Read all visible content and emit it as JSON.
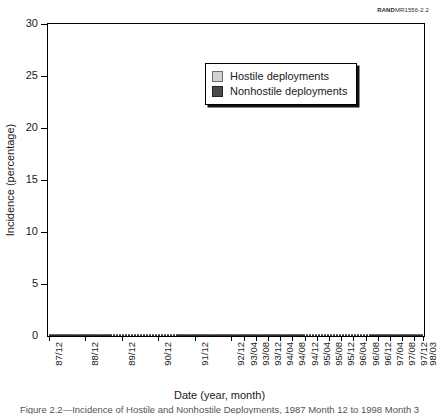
{
  "figure": {
    "rand_code_bold": "RAND",
    "rand_code_rest": "MR1556-2.2",
    "caption": "Figure 2.2—Incidence of Hostile and Nonhostile Deployments, 1987 Month 12 to 1998 Month 3"
  },
  "legend": {
    "items": [
      {
        "label": "Hostile deployments",
        "color": "#d2d2d2"
      },
      {
        "label": "Nonhostile deployments",
        "color": "#4a4a4a"
      }
    ]
  },
  "axes": {
    "ylabel": "Incidence (percentage)",
    "xlabel": "Date (year, month)",
    "yticks": [
      0,
      5,
      10,
      15,
      20,
      25,
      30
    ],
    "xticklabels": [
      "87/12",
      "88/12",
      "89/12",
      "90/12",
      "91/12",
      "92/12",
      "93/04",
      "93/08",
      "93/12",
      "94/04",
      "94/08",
      "94/12",
      "95/04",
      "95/08",
      "95/12",
      "96/04",
      "96/08",
      "96/12",
      "97/04",
      "97/08",
      "97/12",
      "98/03"
    ]
  },
  "chart_data": {
    "type": "bar",
    "title": "",
    "subtitle": "",
    "stacked": true,
    "xlabel": "Date (year, month)",
    "ylabel": "Incidence (percentage)",
    "ylim": [
      0,
      30
    ],
    "grid": false,
    "legend_position": "top-center",
    "annotations": [
      "RANDMR1556-2.2"
    ],
    "categories": [
      "87/12",
      "88/01",
      "88/02",
      "88/03",
      "88/04",
      "88/05",
      "88/06",
      "88/07",
      "88/08",
      "88/09",
      "88/10",
      "88/11",
      "88/12",
      "89/01",
      "89/02",
      "89/03",
      "89/04",
      "89/05",
      "89/06",
      "89/07",
      "89/08",
      "89/09",
      "89/10",
      "89/11",
      "89/12",
      "90/01",
      "90/02",
      "90/03",
      "90/04",
      "90/05",
      "90/06",
      "90/07",
      "90/08",
      "90/09",
      "90/10",
      "90/11",
      "90/12",
      "91/01",
      "91/02",
      "91/03",
      "91/04",
      "91/05",
      "91/06",
      "91/07",
      "91/08",
      "91/09",
      "91/10",
      "91/11",
      "91/12",
      "92/01",
      "92/02",
      "92/03",
      "92/04",
      "92/05",
      "92/06",
      "92/07",
      "92/08",
      "92/09",
      "92/10",
      "92/11",
      "92/12",
      "93/01",
      "93/02",
      "93/03",
      "93/04",
      "93/05",
      "93/06",
      "93/07",
      "93/08",
      "93/09",
      "93/10",
      "93/11",
      "93/12",
      "94/01",
      "94/02",
      "94/03",
      "94/04",
      "94/05",
      "94/06",
      "94/07",
      "94/08",
      "94/09",
      "94/10",
      "94/11",
      "94/12",
      "95/01",
      "95/02",
      "95/03",
      "95/04",
      "95/05",
      "95/06",
      "95/07",
      "95/08",
      "95/09",
      "95/10",
      "95/11",
      "95/12",
      "96/01",
      "96/02",
      "96/03",
      "96/04",
      "96/05",
      "96/06",
      "96/07",
      "96/08",
      "96/09",
      "96/10",
      "96/11",
      "96/12",
      "97/01",
      "97/02",
      "97/03",
      "97/04",
      "97/05",
      "97/06",
      "97/07",
      "97/08",
      "97/09",
      "97/10",
      "97/11",
      "97/12",
      "98/01",
      "98/02",
      "98/03"
    ],
    "series": [
      {
        "name": "Nonhostile deployments",
        "color": "#4d4d4d",
        "values": [
          2.3,
          2.2,
          2.2,
          2.3,
          2.2,
          2.3,
          2.2,
          2.3,
          2.4,
          2.3,
          2.4,
          2.4,
          2.5,
          2.4,
          2.5,
          2.6,
          2.5,
          2.6,
          2.7,
          2.6,
          2.7,
          2.8,
          2.9,
          2.8,
          3.0,
          3.1,
          3.0,
          3.2,
          3.1,
          3.2,
          3.1,
          3.2,
          3.3,
          3.2,
          3.4,
          3.3,
          3.6,
          3.4,
          3.3,
          3.2,
          3.1,
          3.0,
          3.1,
          3.0,
          3.1,
          3.0,
          3.1,
          3.2,
          3.3,
          3.2,
          3.3,
          3.2,
          3.3,
          3.2,
          3.3,
          3.4,
          3.3,
          3.4,
          3.3,
          3.4,
          3.5,
          3.4,
          3.5,
          3.6,
          3.5,
          3.6,
          3.5,
          3.6,
          3.7,
          3.6,
          3.7,
          3.6,
          3.8,
          3.7,
          3.8,
          3.9,
          3.8,
          3.9,
          4.0,
          3.9,
          4.0,
          3.9,
          4.0,
          4.1,
          4.2,
          4.1,
          4.2,
          4.1,
          4.2,
          4.3,
          4.2,
          4.3,
          4.2,
          4.3,
          4.4,
          4.3,
          4.4,
          4.3,
          4.4,
          4.5,
          4.4,
          4.5,
          4.4,
          4.5,
          4.6,
          4.5,
          4.4,
          4.5,
          4.4,
          4.3,
          4.4,
          4.3,
          4.4,
          4.3,
          4.2,
          4.3,
          4.2,
          4.3,
          4.2,
          4.3,
          4.2,
          4.1,
          4.2,
          4.6
        ]
      },
      {
        "name": "Hostile deployments",
        "color": "#c9c9c9",
        "values": [
          0.2,
          0.1,
          0.2,
          0.1,
          0.2,
          0.1,
          0.2,
          0.3,
          0.2,
          0.3,
          0.2,
          0.3,
          0.3,
          0.2,
          0.3,
          0.4,
          0.3,
          0.4,
          0.3,
          0.4,
          0.5,
          0.4,
          0.5,
          0.4,
          0.6,
          0.5,
          0.6,
          0.5,
          0.6,
          0.7,
          0.6,
          0.5,
          0.6,
          0.5,
          1.6,
          11.6,
          21.4,
          7.4,
          1.9,
          1.2,
          0.9,
          0.7,
          0.6,
          0.5,
          0.6,
          0.5,
          0.6,
          0.5,
          0.9,
          1.3,
          1.6,
          1.4,
          1.2,
          1.0,
          0.9,
          0.8,
          0.9,
          0.8,
          0.7,
          0.8,
          1.0,
          1.2,
          1.4,
          1.8,
          2.6,
          3.4,
          2.2,
          1.6,
          1.3,
          1.1,
          1.0,
          0.9,
          1.2,
          1.5,
          2.0,
          2.6,
          3.3,
          2.6,
          2.2,
          1.9,
          2.4,
          2.0,
          1.7,
          1.5,
          2.6,
          2.2,
          1.9,
          1.7,
          2.2,
          2.0,
          2.6,
          2.3,
          3.4,
          3.1,
          2.8,
          3.0,
          3.5,
          3.2,
          3.0,
          2.7,
          2.9,
          2.6,
          3.1,
          2.8,
          3.2,
          2.9,
          2.6,
          2.4,
          2.2,
          2.0,
          2.3,
          2.6,
          3.0,
          2.7,
          2.4,
          2.8,
          2.5,
          2.2,
          2.0,
          2.3,
          2.1,
          1.9,
          2.2,
          3.9
        ]
      }
    ]
  }
}
